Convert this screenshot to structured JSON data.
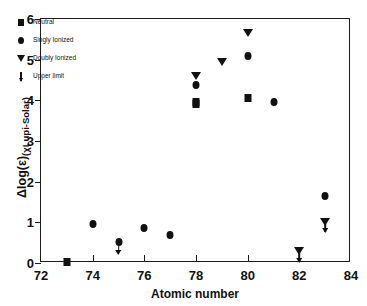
{
  "chart_data": {
    "type": "scatter",
    "title": "",
    "xlabel": "Atomic number",
    "ylabel_main": "Δlog(ε)",
    "ylabel_sub": "(χLupi-Solar)",
    "xlim": [
      72,
      84
    ],
    "ylim": [
      0,
      6
    ],
    "xticks": [
      72,
      74,
      76,
      78,
      80,
      82,
      84
    ],
    "yticks": [
      0,
      1,
      2,
      3,
      4,
      5,
      6
    ],
    "grid": false,
    "legend_position": "upper-left",
    "legend": [
      {
        "label": "Neutral",
        "marker": "square"
      },
      {
        "label": "Singly Ionized",
        "marker": "circle"
      },
      {
        "label": "Doubly Ionized",
        "marker": "triangle-down"
      },
      {
        "label": "Upper limit",
        "marker": "down-arrow"
      }
    ],
    "series": [
      {
        "name": "Neutral",
        "marker": "square",
        "points": [
          {
            "x": 73,
            "y": 0.02
          },
          {
            "x": 78,
            "y": 3.9
          },
          {
            "x": 78,
            "y": 3.97
          },
          {
            "x": 80,
            "y": 4.05
          }
        ]
      },
      {
        "name": "Singly Ionized",
        "marker": "circle",
        "points": [
          {
            "x": 74,
            "y": 0.95
          },
          {
            "x": 75,
            "y": 0.52
          },
          {
            "x": 76,
            "y": 0.87
          },
          {
            "x": 77,
            "y": 0.7
          },
          {
            "x": 78,
            "y": 4.37
          },
          {
            "x": 80,
            "y": 5.09
          },
          {
            "x": 81,
            "y": 3.97
          },
          {
            "x": 83,
            "y": 1.65
          }
        ]
      },
      {
        "name": "Doubly Ionized",
        "marker": "triangle-down",
        "points": [
          {
            "x": 78,
            "y": 4.61
          },
          {
            "x": 79,
            "y": 4.95
          },
          {
            "x": 80,
            "y": 5.65
          },
          {
            "x": 82,
            "y": 0.3
          },
          {
            "x": 83,
            "y": 1.02
          }
        ]
      },
      {
        "name": "Upper limit",
        "marker": "down-arrow",
        "points": [
          {
            "x": 75,
            "y": 0.44,
            "y_end": 0.22
          },
          {
            "x": 82,
            "y": 0.24,
            "y_end": 0.02
          },
          {
            "x": 83,
            "y": 0.96,
            "y_end": 0.76
          }
        ]
      }
    ]
  }
}
